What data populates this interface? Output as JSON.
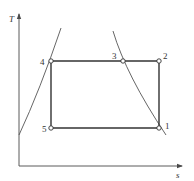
{
  "diagram": {
    "type": "T-s diagram",
    "axes": {
      "y_label": "T",
      "x_label": "s"
    },
    "points": [
      {
        "id": "1",
        "label": "1"
      },
      {
        "id": "2",
        "label": "2"
      },
      {
        "id": "3",
        "label": "3"
      },
      {
        "id": "4",
        "label": "4"
      },
      {
        "id": "5",
        "label": "5"
      }
    ],
    "cycle": [
      "1",
      "2",
      "3",
      "4",
      "5",
      "1"
    ],
    "colors": {
      "line": "#4a4a4a",
      "cycle": "#333333",
      "marker_fill": "#ffffff"
    }
  }
}
